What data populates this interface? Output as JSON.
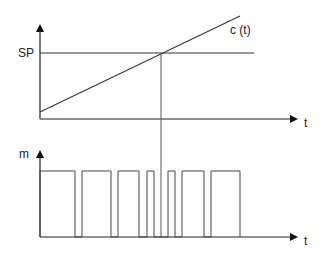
{
  "diagram": {
    "top_plot": {
      "y_axis_label": "SP",
      "x_axis_label": "t",
      "curve_label": "c (t)",
      "setpoint_level": "SP"
    },
    "bottom_plot": {
      "y_axis_label": "m",
      "x_axis_label": "t"
    },
    "colors": {
      "stroke": "#333333",
      "background": "#ffffff"
    }
  }
}
